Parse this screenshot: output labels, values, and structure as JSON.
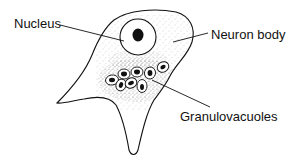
{
  "diagram": {
    "labels": {
      "nucleus": "Nucleus",
      "neuron_body": "Neuron body",
      "granulovacuoles": "Granulovacuoles"
    },
    "colors": {
      "ink": "#111111",
      "background": "#ffffff",
      "stipple": "#555555"
    }
  }
}
